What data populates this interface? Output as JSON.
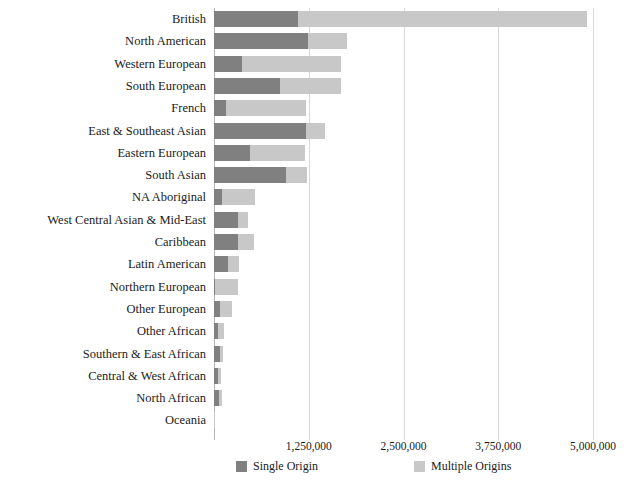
{
  "chart_data": {
    "type": "bar",
    "orientation": "horizontal",
    "stacked": true,
    "title": "",
    "xlabel": "",
    "ylabel": "",
    "xlim": [
      0,
      5000000
    ],
    "grid": true,
    "legend_position": "bottom",
    "xticks": [
      0,
      1250000,
      2500000,
      3750000,
      5000000
    ],
    "xticklabels": [
      "",
      "1,250,000",
      "2,500,000",
      "3,750,000",
      "5,000,000"
    ],
    "categories": [
      "British",
      "North American",
      "Western European",
      "South European",
      "French",
      "East & Southeast Asian",
      "Eastern European",
      "South Asian",
      "NA Aboriginal",
      "West Central Asian & Mid-East",
      "Caribbean",
      "Latin American",
      "Northern European",
      "Other European",
      "Other African",
      "Southern & East African",
      "Central & West African",
      "North African",
      "Oceania"
    ],
    "series": [
      {
        "name": "Single Origin",
        "color": "#808080",
        "values": [
          1110000,
          1240000,
          370000,
          870000,
          160000,
          1215000,
          475000,
          950000,
          105000,
          315000,
          315000,
          185000,
          15000,
          80000,
          55000,
          80000,
          55000,
          65000,
          5000
        ]
      },
      {
        "name": "Multiple Origins",
        "color": "#c8c8c8",
        "values": [
          3810000,
          515000,
          1305000,
          805000,
          1055000,
          250000,
          725000,
          275000,
          435000,
          135000,
          210000,
          145000,
          300000,
          155000,
          75000,
          40000,
          40000,
          40000,
          3000
        ]
      }
    ],
    "totals": [
      4920000,
      1755000,
      1675000,
      1675000,
      1215000,
      1465000,
      1200000,
      1225000,
      540000,
      450000,
      525000,
      330000,
      315000,
      235000,
      130000,
      120000,
      95000,
      105000,
      8000
    ]
  },
  "legend": {
    "items": [
      {
        "label": "Single Origin",
        "color": "#808080"
      },
      {
        "label": "Multiple Origins",
        "color": "#c8c8c8"
      }
    ]
  },
  "colors": {
    "single_origin": "#808080",
    "multiple_origins": "#c8c8c8",
    "gridline": "#d8d8d8",
    "axis": "#b4b4b4",
    "text": "#1a1a1a",
    "background": "#ffffff"
  }
}
